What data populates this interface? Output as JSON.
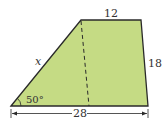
{
  "diagram": {
    "shape": "trapezoid",
    "fill_color": "#c5db84",
    "stroke_color": "#2a2a2a",
    "labels": {
      "top": "12",
      "right": "18",
      "left": "x",
      "angle": "50°",
      "bottom": "28"
    }
  }
}
